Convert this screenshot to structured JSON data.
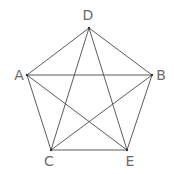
{
  "diagram": {
    "line_color": "#4a4a4a",
    "label_color": "#6b6b6b",
    "vertices": [
      {
        "id": "D",
        "label": "D",
        "x": 89,
        "y": 28,
        "lx": 88,
        "ly": 20
      },
      {
        "id": "A",
        "label": "A",
        "x": 27,
        "y": 75,
        "lx": 19,
        "ly": 80
      },
      {
        "id": "B",
        "label": "B",
        "x": 152,
        "y": 75,
        "lx": 161,
        "ly": 80
      },
      {
        "id": "C",
        "label": "C",
        "x": 51,
        "y": 150,
        "lx": 49,
        "ly": 166
      },
      {
        "id": "E",
        "label": "E",
        "x": 127,
        "y": 150,
        "lx": 130,
        "ly": 166
      }
    ],
    "edges": [
      [
        "D",
        "A"
      ],
      [
        "D",
        "B"
      ],
      [
        "D",
        "C"
      ],
      [
        "D",
        "E"
      ],
      [
        "A",
        "B"
      ],
      [
        "A",
        "C"
      ],
      [
        "A",
        "E"
      ],
      [
        "B",
        "C"
      ],
      [
        "B",
        "E"
      ],
      [
        "C",
        "E"
      ]
    ]
  }
}
